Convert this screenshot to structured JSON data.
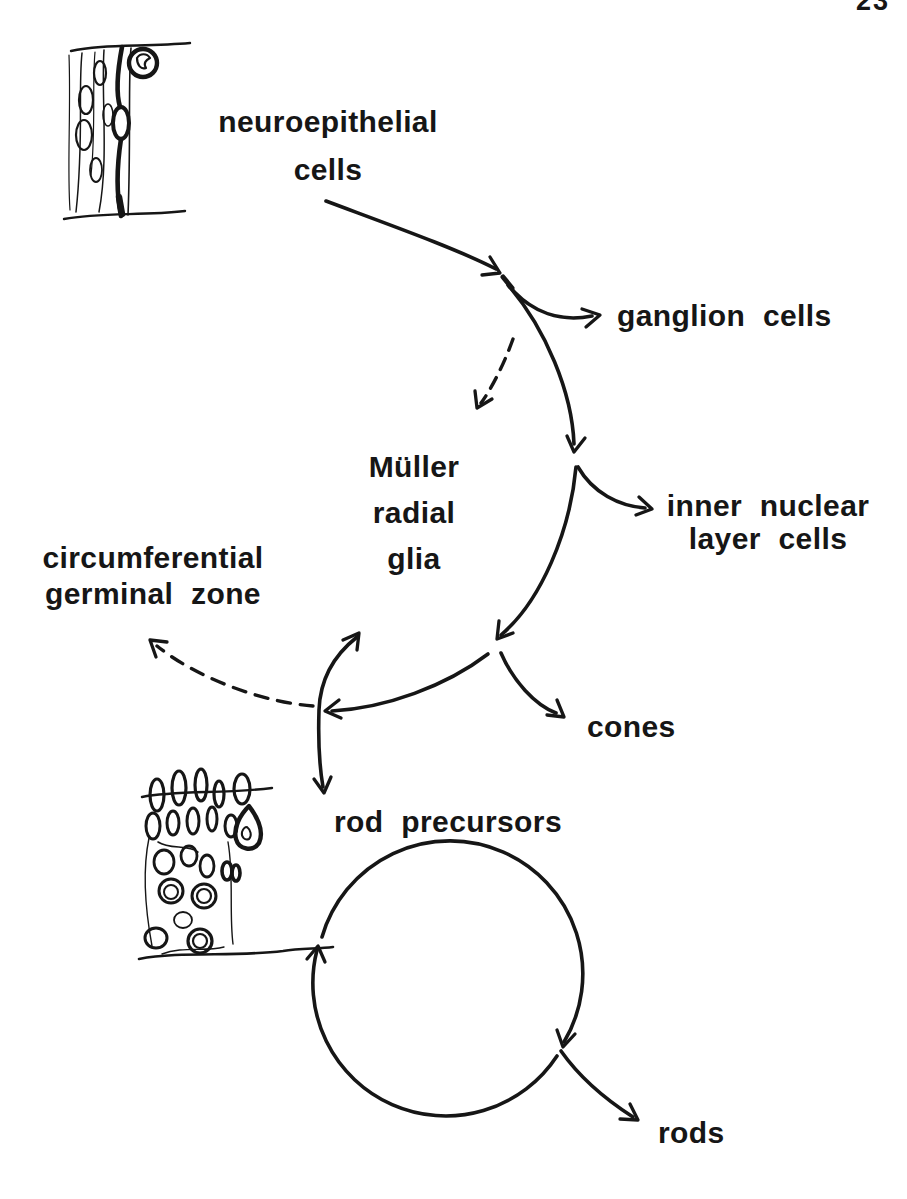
{
  "page": {
    "number": "23",
    "background_color": "#ffffff",
    "ink_color": "#161616"
  },
  "labels": {
    "neuroepithelial": {
      "line1": "neuroepithelial",
      "line2": "cells"
    },
    "ganglion_cells": {
      "text": "ganglion cells"
    },
    "muller_glia": {
      "line1": "Müller",
      "line2": "radial",
      "line3": "glia"
    },
    "inner_nuclear": {
      "line1": "inner nuclear",
      "line2": "layer cells"
    },
    "circumferential_germinal_zone": {
      "line1": "circumferential",
      "line2": "germinal zone"
    },
    "cones": {
      "text": "cones"
    },
    "rod_precursors": {
      "text": "rod precursors"
    },
    "rods": {
      "text": "rods"
    }
  },
  "diagram": {
    "type": "hand-drawn cell lineage flow diagram",
    "edges": [
      {
        "from": "neuroepithelial cells",
        "to": "branch point 1",
        "style": "solid-arrow"
      },
      {
        "from": "branch point 1",
        "to": "ganglion cells",
        "style": "solid-arrow"
      },
      {
        "from": "branch point 1",
        "to": "Müller radial glia",
        "style": "dashed-arrow"
      },
      {
        "from": "branch point 1",
        "to": "branch point 2",
        "style": "solid-arrow"
      },
      {
        "from": "branch point 2",
        "to": "inner nuclear layer cells",
        "style": "solid-arrow"
      },
      {
        "from": "branch point 2",
        "to": "branch point 3",
        "style": "solid-arrow"
      },
      {
        "from": "branch point 3",
        "to": "cones",
        "style": "solid-arrow"
      },
      {
        "from": "branch point 3",
        "to": "branch point 4",
        "style": "solid-arrow-pointing-left"
      },
      {
        "from": "branch point 4",
        "to": "circumferential germinal zone",
        "style": "dashed-arrow"
      },
      {
        "from": "branch point 4",
        "to": "rod precursors",
        "style": "double-headed-solid-arrow"
      },
      {
        "from": "rod precursors",
        "to": "rod precursors",
        "style": "self-renewal circle, clockwise, two arrowheads"
      },
      {
        "from": "rod precursor cycle",
        "to": "rods",
        "style": "solid-arrow"
      }
    ],
    "sketches": [
      {
        "name": "neuroepithelial-tissue-sketch",
        "depicts": "columnar neuroepithelium with mitotic cell at apical surface"
      },
      {
        "name": "rod-precursor-tissue-sketch",
        "depicts": "retinal cell column of rounded nuclei with dark pyknotic figure"
      }
    ]
  }
}
